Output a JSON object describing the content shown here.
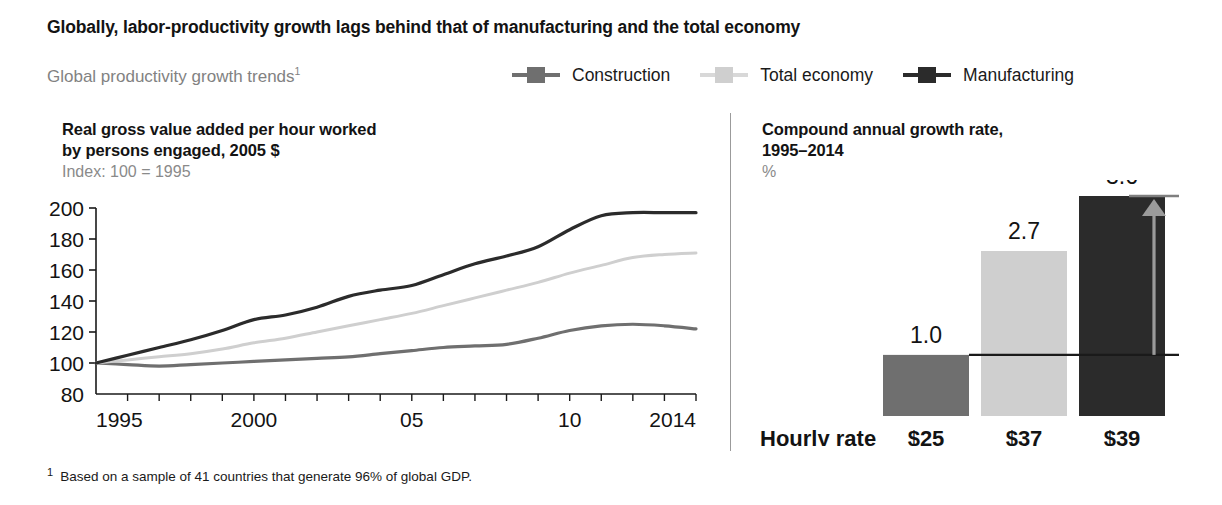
{
  "title": "Globally, labor-productivity growth lags behind that of manufacturing and the total economy",
  "subtitle": "Global productivity growth trends",
  "subtitle_footnote_mark": "1",
  "legend": {
    "items": [
      {
        "label": "Construction",
        "color": "#6f6f6f",
        "icon": "line-square-marker"
      },
      {
        "label": "Total economy",
        "color": "#cfcfcf",
        "icon": "line-square-marker"
      },
      {
        "label": "Manufacturing",
        "color": "#2b2b2b",
        "icon": "line-square-marker"
      }
    ]
  },
  "left_panel": {
    "heading_line1": "Real gross value added per hour worked",
    "heading_line2": "by persons engaged, 2005 $",
    "subheading": "Index: 100 = 1995"
  },
  "right_panel": {
    "heading_line1": "Compound annual growth rate,",
    "heading_line2": "1995–2014",
    "subheading": "%",
    "hourly_rate_label": "Hourly rate",
    "delta_label": "+2.6"
  },
  "footnote": {
    "mark": "1",
    "text": "Based on a sample of 41 countries that generate 96% of global GDP."
  },
  "chart_data": [
    {
      "type": "line",
      "title": "Real gross value added per hour worked by persons engaged, 2005 $",
      "subtitle": "Index: 100 = 1995",
      "xlabel": "",
      "ylabel": "",
      "xlim": [
        1995,
        2014
      ],
      "ylim": [
        80,
        200
      ],
      "yticks": [
        80,
        100,
        120,
        140,
        160,
        180,
        200
      ],
      "ytick_labels": [
        "80",
        "100",
        "120",
        "140",
        "160",
        "180",
        "200"
      ],
      "xticks": [
        1995,
        1996,
        1997,
        1998,
        1999,
        2000,
        2001,
        2002,
        2003,
        2004,
        2005,
        2006,
        2007,
        2008,
        2009,
        2010,
        2011,
        2012,
        2013,
        2014
      ],
      "xtick_labels": [
        "1995",
        "",
        "",
        "",
        "",
        "2000",
        "",
        "",
        "",
        "",
        "05",
        "",
        "",
        "",
        "",
        "10",
        "",
        "",
        "",
        "2014"
      ],
      "grid": false,
      "legend_position": "top",
      "x": [
        1995,
        1996,
        1997,
        1998,
        1999,
        2000,
        2001,
        2002,
        2003,
        2004,
        2005,
        2006,
        2007,
        2008,
        2009,
        2010,
        2011,
        2012,
        2013,
        2014
      ],
      "series": [
        {
          "name": "Manufacturing",
          "color": "#2b2b2b",
          "values": [
            100,
            105,
            110,
            115,
            121,
            128,
            131,
            136,
            143,
            147,
            150,
            157,
            164,
            169,
            175,
            186,
            195,
            197,
            197,
            197
          ]
        },
        {
          "name": "Total economy",
          "color": "#cfcfcf",
          "values": [
            100,
            102,
            104,
            106,
            109,
            113,
            116,
            120,
            124,
            128,
            132,
            137,
            142,
            147,
            152,
            158,
            163,
            168,
            170,
            171
          ]
        },
        {
          "name": "Construction",
          "color": "#6f6f6f",
          "values": [
            100,
            99,
            98,
            99,
            100,
            101,
            102,
            103,
            104,
            106,
            108,
            110,
            111,
            112,
            116,
            121,
            124,
            125,
            124,
            122
          ]
        }
      ]
    },
    {
      "type": "bar",
      "title": "Compound annual growth rate, 1995–2014",
      "subtitle": "%",
      "xlabel": "",
      "ylabel": "%",
      "ylim": [
        0,
        3.6
      ],
      "grid": false,
      "categories": [
        "Construction",
        "Total economy",
        "Manufacturing"
      ],
      "values": [
        1.0,
        2.7,
        3.6
      ],
      "value_labels": [
        "1.0",
        "2.7",
        "3.6"
      ],
      "colors": [
        "#6f6f6f",
        "#cfcfcf",
        "#2b2b2b"
      ],
      "row_label": "Hourly rate",
      "hourly_rates": [
        "$25",
        "$37",
        "$39"
      ],
      "annotation": {
        "label": "+2.6",
        "from_value": 1.0,
        "to_value": 3.6,
        "color": "#9b9b9b"
      }
    }
  ]
}
